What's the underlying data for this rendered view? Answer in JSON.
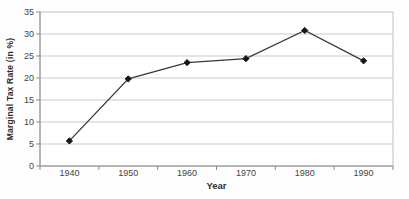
{
  "chart_data": {
    "type": "line",
    "title": "",
    "xlabel": "Year",
    "ylabel": "Marginal Tax Rate (in %)",
    "categories": [
      "1940",
      "1950",
      "1960",
      "1970",
      "1980",
      "1990"
    ],
    "series": [
      {
        "name": "Marginal Tax Rate (in %)",
        "values": [
          5.7,
          19.8,
          23.5,
          24.4,
          30.8,
          23.9
        ]
      }
    ],
    "ylim": [
      0,
      35
    ],
    "yticks": [
      0,
      5,
      10,
      15,
      20,
      25,
      30,
      35
    ],
    "grid": "horizontal",
    "legend": "none",
    "marker": "diamond",
    "colors": {
      "line": "#3a3a3a",
      "marker": "#161616",
      "grid": "#c9c9c9",
      "axis": "#8c8c8c",
      "border": "#bfbfbf",
      "text": "#3d3d3d"
    }
  }
}
